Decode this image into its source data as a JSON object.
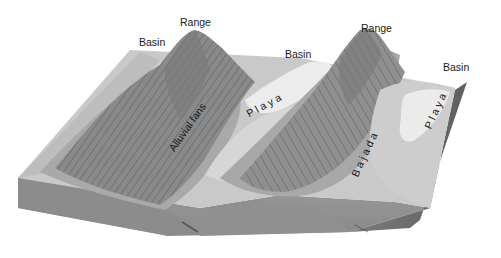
{
  "diagram": {
    "title": "",
    "type": "block diagram (basin and range landscape)",
    "labels": {
      "basin_left": "Basin",
      "range_left": "Range",
      "basin_middle": "Basin",
      "range_right": "Range",
      "basin_right": "Basin",
      "alluvial_fans": "Alluvial fans",
      "playa_left": "P l a y a",
      "bajada": "B a j a d a",
      "playa_right": "P l a y a"
    },
    "colors": {
      "background": "#ffffff",
      "mountain_dark": "#7d7d7d",
      "mountain_mid": "#999999",
      "fan_gray": "#b5b5b5",
      "basin_light": "#cfcfcf",
      "playa_white": "#ececec",
      "block_side": "#8f8f8f",
      "block_edge_dark": "#6e6e6e",
      "text": "#1a1a1a"
    }
  }
}
